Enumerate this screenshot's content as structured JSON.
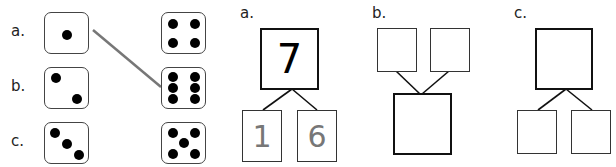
{
  "matching": {
    "rows": [
      {
        "label": "a.",
        "left_die": 1,
        "right_die": 4
      },
      {
        "label": "b.",
        "left_die": 2,
        "right_die": 6
      },
      {
        "label": "c.",
        "left_die": 3,
        "right_die": 5
      }
    ],
    "connection": {
      "from": "a-left (1)",
      "to": "b-right (6)"
    }
  },
  "number_bonds": [
    {
      "label": "a.",
      "orientation": "whole-top",
      "whole": "7",
      "parts": [
        "1",
        "6"
      ]
    },
    {
      "label": "b.",
      "orientation": "whole-bottom",
      "whole": "",
      "parts": [
        "",
        ""
      ]
    },
    {
      "label": "c.",
      "orientation": "whole-top",
      "whole": "",
      "parts": [
        "",
        ""
      ]
    }
  ],
  "colors": {
    "line": "#777777",
    "pip": "#000000",
    "part_text": "#777777"
  }
}
